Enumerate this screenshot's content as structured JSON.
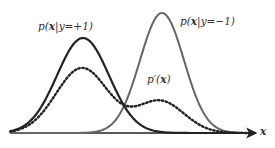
{
  "chart_data": {
    "type": "line",
    "title": "",
    "xlabel": "x",
    "ylabel": "",
    "grid": false,
    "series": [
      {
        "name": "p(x|y=+1)",
        "style": "solid",
        "color": "#222222",
        "peak_x": 83,
        "peak_y": 38,
        "sigma": 26
      },
      {
        "name": "p(x|y=-1)",
        "style": "solid",
        "color": "#666666",
        "peak_x": 162,
        "peak_y": 13,
        "sigma": 22
      },
      {
        "name": "p'(x)",
        "style": "dotted",
        "color": "#222222",
        "components": [
          {
            "peak_x": 82,
            "height": 65,
            "sigma": 26
          },
          {
            "peak_x": 160,
            "height": 32,
            "sigma": 24
          }
        ]
      }
    ],
    "baseline_y": 133,
    "axis_x_start": 10,
    "axis_x_end": 256
  },
  "labels": {
    "pos_class": {
      "prefix": "p(",
      "var": "x",
      "mid": "|y=+1)"
    },
    "neg_class": {
      "prefix": "p(",
      "var": "x",
      "mid": "|y=−1)"
    },
    "mixture": {
      "prefix": "p′(",
      "var": "x",
      "mid": ")"
    },
    "axis": "x"
  }
}
